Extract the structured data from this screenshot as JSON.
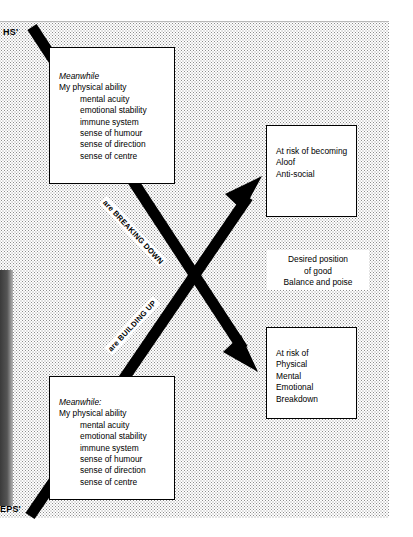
{
  "page": {
    "corner_labels": {
      "top_left": "HS'",
      "bottom_left": "EPS'"
    }
  },
  "boxes": {
    "top_left": {
      "heading": "Meanwhile",
      "lead": "My physical ability",
      "items": [
        "mental acuity",
        "emotional stability",
        "immune system",
        "sense of humour",
        "sense of direction",
        "sense of centre"
      ]
    },
    "bottom_left": {
      "heading": "Meanwhile:",
      "lead": "My physical ability",
      "items": [
        "mental acuity",
        "emotional stability",
        "immune system",
        "sense of humour",
        "sense of direction",
        "sense of centre"
      ]
    },
    "top_right": {
      "lead": "At risk of becoming",
      "items": [
        "Aloof",
        "Anti-social"
      ]
    },
    "bottom_right": {
      "lead": "At risk of",
      "items": [
        "Physical",
        "Mental",
        "Emotional",
        "Breakdown"
      ]
    },
    "centre": {
      "line1": "Desired position",
      "line2": "of good",
      "line3": "Balance and poise"
    }
  },
  "arrows": {
    "breaking_down_caption": "are BREAKING DOWN",
    "building_up_caption": "are BUILDING UP",
    "color": "#000000"
  }
}
